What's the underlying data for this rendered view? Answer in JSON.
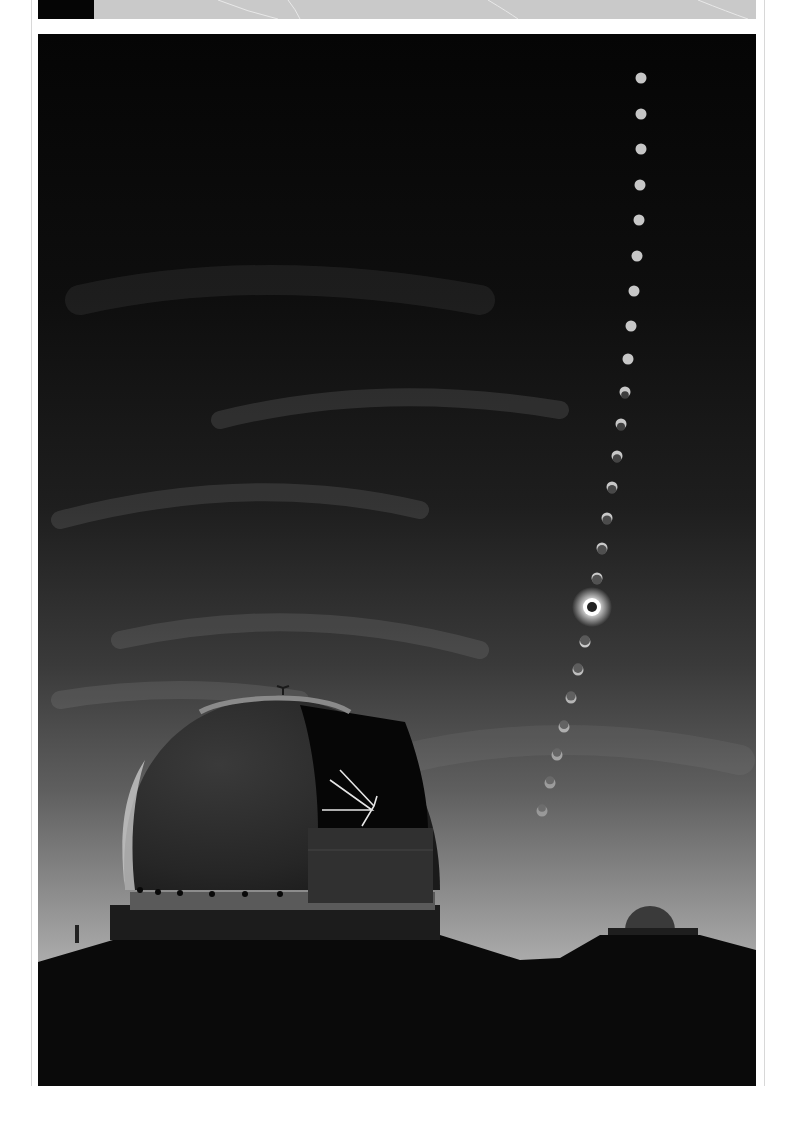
{
  "page": {
    "colors": {
      "sky_top": "#050505",
      "sky_mid": "#3a3a3a",
      "sky_horizon": "#b4b4b4",
      "ground": "#0a0a0a",
      "sun": "#d8d8d8"
    }
  },
  "photo": {
    "subject": "eclipse-sequence-over-observatory",
    "sun_positions": [
      [
        641,
        78
      ],
      [
        641,
        114
      ],
      [
        641,
        149
      ],
      [
        640,
        185
      ],
      [
        639,
        220
      ],
      [
        637,
        256
      ],
      [
        634,
        291
      ],
      [
        631,
        326
      ],
      [
        628,
        359
      ],
      [
        625,
        392
      ],
      [
        621,
        424
      ],
      [
        617,
        456
      ],
      [
        612,
        487
      ],
      [
        607,
        518
      ],
      [
        602,
        548
      ],
      [
        597,
        578
      ],
      [
        585,
        642
      ],
      [
        578,
        670
      ],
      [
        571,
        698
      ],
      [
        564,
        727
      ],
      [
        557,
        755
      ],
      [
        550,
        783
      ],
      [
        542,
        811
      ]
    ],
    "totality_position": [
      592,
      607
    ]
  }
}
